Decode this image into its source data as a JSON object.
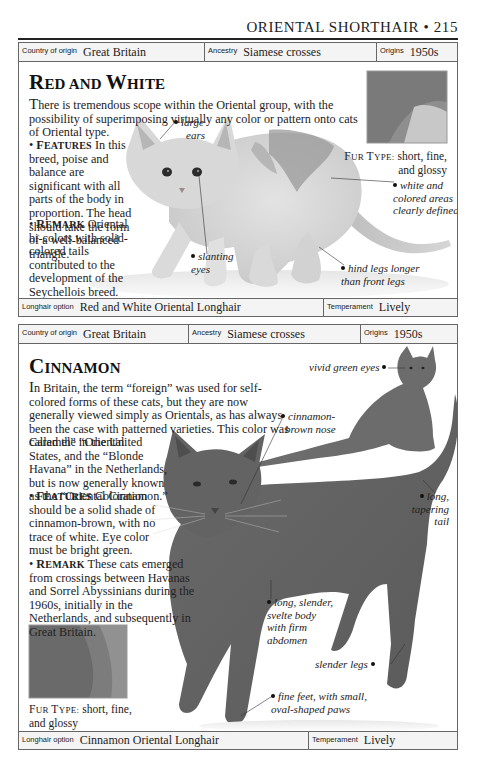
{
  "running_head": {
    "title": "ORIENTAL SHORTHAIR",
    "separator": "•",
    "page_number": "215",
    "full": "ORIENTAL SHORTHAIR • 215"
  },
  "sections": [
    {
      "id": "red-and-white",
      "top_bar": {
        "country_label": "Country of origin",
        "country_value": "Great Britain",
        "ancestry_label": "Ancestry",
        "ancestry_value": "Siamese crosses",
        "origins_label": "Origins",
        "origins_value": "1950s"
      },
      "heading": {
        "cap1": "R",
        "rest1": "ED AND ",
        "cap2": "W",
        "rest2": "HITE",
        "full": "Red and White"
      },
      "intro": {
        "dropcap": "T",
        "text": "here is tremendous scope within the Oriental group, with the possibility of superimposing virtually any color or pattern onto cats of Oriental type."
      },
      "features": {
        "bullet": "•",
        "label_cap": "F",
        "label_rest": "EATURES",
        "text": "In this breed, poise and balance are significant with all parts of the body in proportion. The head should take the form of a well-balanced triangle."
      },
      "remark": {
        "bullet": "•",
        "label_cap": "R",
        "label_rest": "EMARK",
        "text": "Oriental bi-colors with solid-colored tails contributed to the development of the Seychellois breed."
      },
      "fur_type": {
        "label_cap1": "F",
        "label_rest1": "UR ",
        "label_cap2": "T",
        "label_rest2": "YPE:",
        "value": "short, fine, and glossy",
        "line1": "short, fine,",
        "line2": "and glossy"
      },
      "annotations": {
        "large_ears": [
          "large",
          "ears"
        ],
        "slanting_eyes": [
          "slanting",
          "eyes"
        ],
        "white_colored": [
          "white and",
          "colored areas",
          "clearly defined"
        ],
        "hind_legs": [
          "hind legs longer",
          "than front legs"
        ]
      },
      "bottom_bar": {
        "longhair_label": "Longhair option",
        "longhair_value": "Red and White Oriental Longhair",
        "temperament_label": "Temperament",
        "temperament_value": "Lively"
      }
    },
    {
      "id": "cinnamon",
      "top_bar": {
        "country_label": "Country of origin",
        "country_value": "Great Britain",
        "ancestry_label": "Ancestry",
        "ancestry_value": "Siamese crosses",
        "origins_label": "Origins",
        "origins_value": "1950s"
      },
      "heading": {
        "cap1": "C",
        "rest1": "INNAMON",
        "full": "Cinnamon"
      },
      "intro": {
        "dropcap": "I",
        "wide_text": "n Britain, the term “foreign” was used for self-colored forms of these cats, but they are now generally viewed simply as Orientals, as has always been the case with patterned varieties. This color was called the “Oriental",
        "narrow_text": "Caramel” in the United States, and the “Blonde Havana” in the Netherlands, but is now generally known as the “Oriental Cinnamon.”"
      },
      "features": {
        "bullet": "•",
        "label_cap": "F",
        "label_rest": "EATURES",
        "text": "Coloration should be a solid shade of cinnamon-brown, with no trace of white. Eye color must be bright green."
      },
      "remark": {
        "bullet": "•",
        "label_cap": "R",
        "label_rest": "EMARK",
        "text": "These cats emerged from crossings between Havanas and Sorrel Abyssinians during the 1960s, initially in the Netherlands, and subsequently in Great Britain."
      },
      "fur_type": {
        "label_cap1": "F",
        "label_rest1": "UR ",
        "label_cap2": "T",
        "label_rest2": "YPE:",
        "value": "short, fine, and glossy",
        "line1": "short, fine,",
        "line2": "and glossy"
      },
      "annotations": {
        "vivid_green_eyes": [
          "vivid green eyes"
        ],
        "cinnamon_nose": [
          "cinnamon-",
          "brown nose"
        ],
        "long_tail": [
          "long,",
          "tapering",
          "tail"
        ],
        "svelte_body": [
          "long, slender,",
          "svelte body",
          "with firm",
          "abdomen"
        ],
        "slender_legs": [
          "slender legs"
        ],
        "fine_feet": [
          "fine feet, with small,",
          "oval-shaped paws"
        ]
      },
      "bottom_bar": {
        "longhair_label": "Longhair option",
        "longhair_value": "Cinnamon Oriental Longhair",
        "temperament_label": "Temperament",
        "temperament_value": "Lively"
      }
    }
  ]
}
